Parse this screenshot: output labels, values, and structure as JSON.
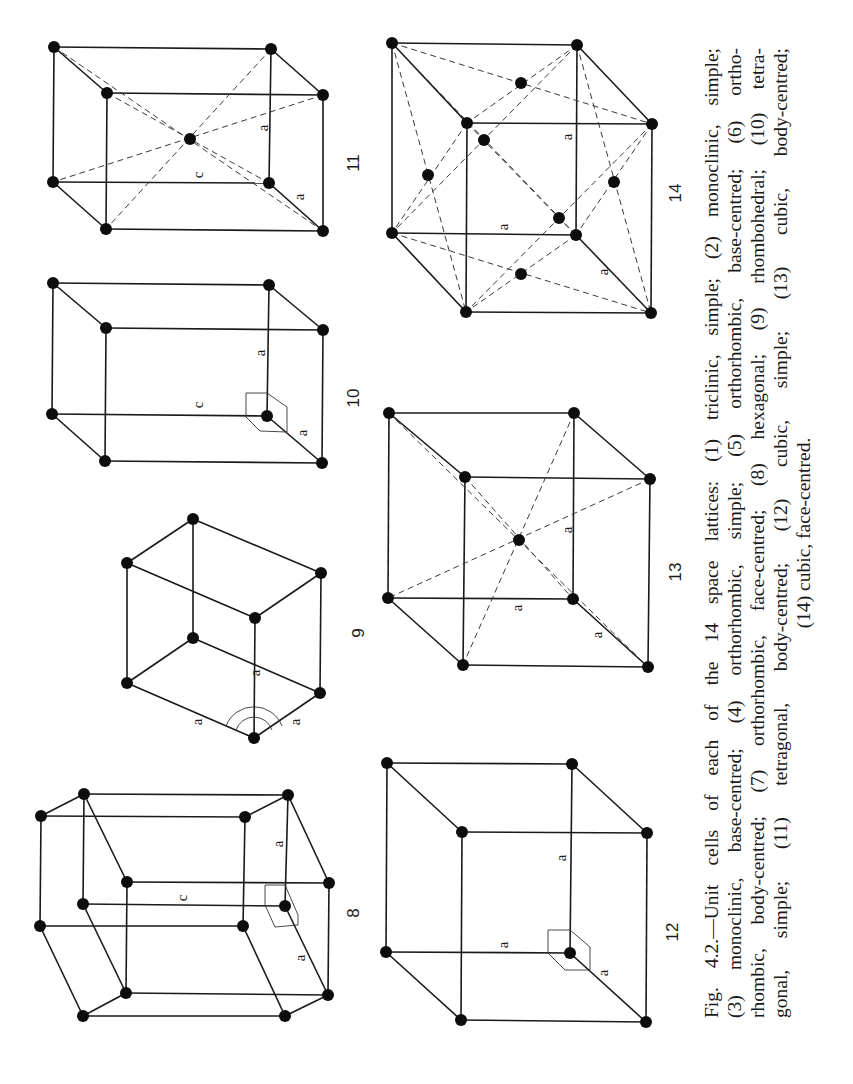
{
  "figure": {
    "number": "Fig. 4.2.",
    "caption_lines": [
      "Fig. 4.2.—Unit cells of each of the 14 space lattices:  (1) triclinic, simple;  (2) monoclinic, simple;",
      "(3) monoclinic, base-centred;  (4) orthorhombic, simple;  (5) orthorhombic, base-centred;  (6) ortho-",
      "rhombic, body-centred; (7) orthorhombic, face-centred; (8) hexagonal; (9) rhombohedral;  (10) tetra-",
      "gonal,  simple;     (11)  tetragonal,  body-centred;     (12)  cubic,  simple;     (13)  cubic,  body-centred;",
      "(14) cubic,  face-centred."
    ],
    "lattices": [
      {
        "id": "8",
        "label": "8",
        "name": "hexagonal",
        "axis_labels": [
          "a",
          "c",
          "a"
        ]
      },
      {
        "id": "9",
        "label": "9",
        "name": "rhombohedral",
        "axis_labels": [
          "a",
          "a",
          "a"
        ]
      },
      {
        "id": "10",
        "label": "10",
        "name": "tetragonal, simple",
        "axis_labels": [
          "a",
          "c",
          "a"
        ]
      },
      {
        "id": "11",
        "label": "11",
        "name": "tetragonal, body-centred",
        "axis_labels": [
          "a",
          "c",
          "a"
        ]
      },
      {
        "id": "12",
        "label": "12",
        "name": "cubic, simple",
        "axis_labels": [
          "a",
          "a",
          "a"
        ]
      },
      {
        "id": "13",
        "label": "13",
        "name": "cubic, body-centred",
        "axis_labels": [
          "a",
          "a",
          "a"
        ]
      },
      {
        "id": "14",
        "label": "14",
        "name": "cubic, face-centred",
        "axis_labels": [
          "a",
          "a",
          "a"
        ]
      }
    ]
  }
}
